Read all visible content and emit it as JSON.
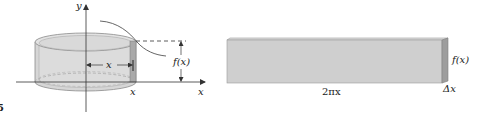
{
  "figure": {
    "left_panel": {
      "axis_labels": {
        "y": "y",
        "x": "x"
      },
      "radius_label": "x",
      "height_label": "f(x)",
      "strip_position_label": "x"
    },
    "right_panel": {
      "width_label": "2πx",
      "height_label": "f(x)",
      "thickness_label": "Δx"
    },
    "figure_number_fragment": "5",
    "colors": {
      "cylinder_fill": "#d4d4d4",
      "cylinder_stroke": "#8a8a8a",
      "strip_fill": "#a9a9a9",
      "slab_fill": "#cfcfcf",
      "slab_edge": "#9a9a9a",
      "axis": "#333333"
    }
  }
}
